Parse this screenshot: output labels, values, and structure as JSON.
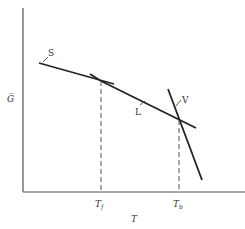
{
  "diagram": {
    "type": "phase-diagram",
    "y_axis_label": "G̅",
    "x_axis_label": "T",
    "tick_labels": {
      "melting": "T",
      "melting_sub": "f",
      "boiling": "T",
      "boiling_sub": "b"
    },
    "curve_labels": {
      "solid": "S",
      "liquid": "L",
      "vapor": "V"
    },
    "colors": {
      "line": "#222222",
      "axis": "#555555",
      "dashed": "#555555"
    }
  }
}
